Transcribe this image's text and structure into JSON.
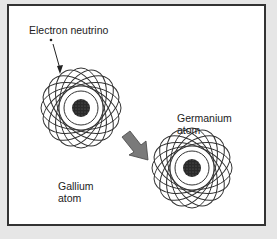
{
  "diagram": {
    "labels": {
      "neutrino": "Electron neutrino",
      "gallium": "Gallium\natom",
      "germanium": "Germanium\natom"
    },
    "colors": {
      "background": "#e6e6e6",
      "panel": "#ffffff",
      "border": "#333333",
      "orbit": "#333333",
      "nucleus": "#2a2a2a",
      "arrow": "#7a7a7a"
    },
    "atoms": [
      {
        "name": "Gallium",
        "cx": 79,
        "cy": 106,
        "r": 40
      },
      {
        "name": "Germanium",
        "cx": 190,
        "cy": 166,
        "r": 40
      }
    ]
  }
}
